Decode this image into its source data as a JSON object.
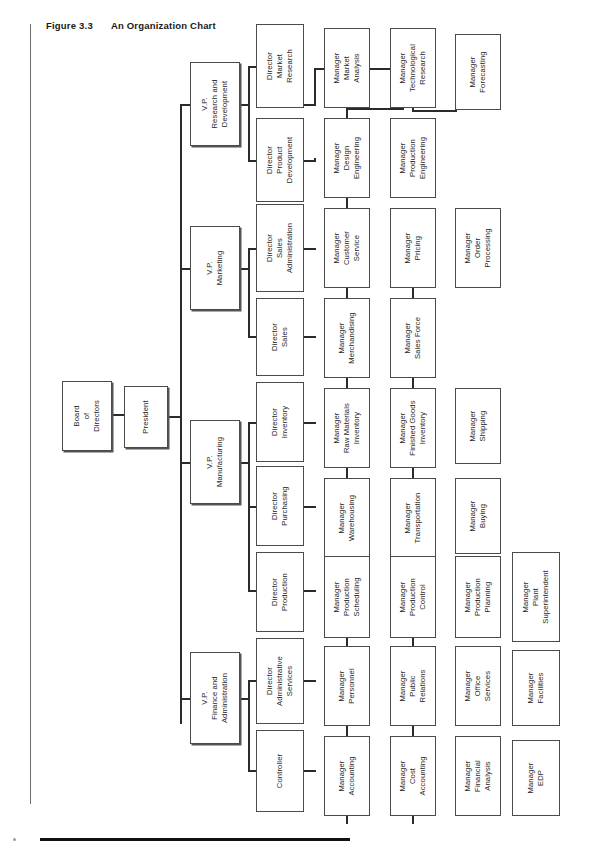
{
  "figure": {
    "number": "Figure 3.3",
    "title": "An Organization Chart"
  },
  "chart_data": {
    "type": "diagram",
    "subtype": "organization-chart",
    "title": "An Organization Chart",
    "orientation": "rotated-90-ccw",
    "levels": [
      "Board",
      "President",
      "Vice Presidents",
      "Directors",
      "Managers"
    ],
    "root": "Board of Directors",
    "nodes": [
      {
        "id": "board",
        "label": "Board\nof\nDirectors",
        "level": 0,
        "parent": null
      },
      {
        "id": "president",
        "label": "President",
        "level": 1,
        "parent": "board"
      },
      {
        "id": "vp_rd",
        "label": "V.P.\nResearch and\nDevelopment",
        "level": 2,
        "parent": "president"
      },
      {
        "id": "vp_mkt",
        "label": "V.P.\nMarketing",
        "level": 2,
        "parent": "president"
      },
      {
        "id": "vp_mfg",
        "label": "V.P.\nManufacturing",
        "level": 2,
        "parent": "president"
      },
      {
        "id": "vp_fin",
        "label": "V.P.\nFinance and\nAdministration",
        "level": 2,
        "parent": "president"
      },
      {
        "id": "d_mktres",
        "label": "Director\nMarket\nResearch",
        "level": 3,
        "parent": "vp_rd"
      },
      {
        "id": "d_proddev",
        "label": "Director\nProduct\nDevelopment",
        "level": 3,
        "parent": "vp_rd"
      },
      {
        "id": "d_salesadm",
        "label": "Director\nSales\nAdministration",
        "level": 3,
        "parent": "vp_mkt"
      },
      {
        "id": "d_sales",
        "label": "Director\nSales",
        "level": 3,
        "parent": "vp_mkt"
      },
      {
        "id": "d_inv",
        "label": "Director\nInventory",
        "level": 3,
        "parent": "vp_mfg"
      },
      {
        "id": "d_purch",
        "label": "Director\nPurchasing",
        "level": 3,
        "parent": "vp_mfg"
      },
      {
        "id": "d_prod",
        "label": "Director\nProduction",
        "level": 3,
        "parent": "vp_mfg"
      },
      {
        "id": "d_admsvc",
        "label": "Director\nAdministrative\nServices",
        "level": 3,
        "parent": "vp_fin"
      },
      {
        "id": "d_ctrl",
        "label": "Controller",
        "level": 3,
        "parent": "vp_fin"
      },
      {
        "id": "m_mktanal",
        "label": "Manager\nMarket\nAnalysis",
        "level": 4,
        "parent": "d_mktres"
      },
      {
        "id": "m_techres",
        "label": "Manager\nTechnological\nResearch",
        "level": 4,
        "parent": "d_mktres"
      },
      {
        "id": "m_forecast",
        "label": "Manager\nForecasting",
        "level": 4,
        "parent": "d_mktres"
      },
      {
        "id": "m_desgeng",
        "label": "Manager\nDesign\nEngineering",
        "level": 4,
        "parent": "d_proddev"
      },
      {
        "id": "m_prodeng",
        "label": "Manager\nProduction\nEngineering",
        "level": 4,
        "parent": "d_proddev"
      },
      {
        "id": "m_custsvc",
        "label": "Manager\nCustomer\nService",
        "level": 4,
        "parent": "d_salesadm"
      },
      {
        "id": "m_pricing",
        "label": "Manager\nPricing",
        "level": 4,
        "parent": "d_salesadm"
      },
      {
        "id": "m_orderproc",
        "label": "Manager\nOrder\nProcessing",
        "level": 4,
        "parent": "d_salesadm"
      },
      {
        "id": "m_merch",
        "label": "Manager\nMerchandising",
        "level": 4,
        "parent": "d_sales"
      },
      {
        "id": "m_salesforce",
        "label": "Manager\nSales Force",
        "level": 4,
        "parent": "d_sales"
      },
      {
        "id": "m_rawmat",
        "label": "Manager\nRaw Materials\nInventory",
        "level": 4,
        "parent": "d_inv"
      },
      {
        "id": "m_fingoods",
        "label": "Manager\nFinished Goods\nInventory",
        "level": 4,
        "parent": "d_inv"
      },
      {
        "id": "m_shipping",
        "label": "Manager\nShipping",
        "level": 4,
        "parent": "d_inv"
      },
      {
        "id": "m_warehouse",
        "label": "Manager\nWarehousing",
        "level": 4,
        "parent": "d_purch"
      },
      {
        "id": "m_transport",
        "label": "Manager\nTransportation",
        "level": 4,
        "parent": "d_purch"
      },
      {
        "id": "m_buying",
        "label": "Manager\nBuying",
        "level": 4,
        "parent": "d_purch"
      },
      {
        "id": "m_prodsched",
        "label": "Manager\nProduction\nScheduling",
        "level": 4,
        "parent": "d_prod"
      },
      {
        "id": "m_prodctrl",
        "label": "Manager\nProduction\nControl",
        "level": 4,
        "parent": "d_prod"
      },
      {
        "id": "m_prodplan",
        "label": "Manager\nProduction\nPlanning",
        "level": 4,
        "parent": "d_prod"
      },
      {
        "id": "m_plantsup",
        "label": "Manager\nPlant\nSuperintendent",
        "level": 4,
        "parent": "d_prod"
      },
      {
        "id": "m_personnel",
        "label": "Manager\nPersonnel",
        "level": 4,
        "parent": "d_admsvc"
      },
      {
        "id": "m_pubrel",
        "label": "Manager\nPublic\nRelations",
        "level": 4,
        "parent": "d_admsvc"
      },
      {
        "id": "m_offsvc",
        "label": "Manager\nOffice\nServices",
        "level": 4,
        "parent": "d_admsvc"
      },
      {
        "id": "m_facil",
        "label": "Manager\nFacilities",
        "level": 4,
        "parent": "d_admsvc"
      },
      {
        "id": "m_acct",
        "label": "Manager\nAccounting",
        "level": 4,
        "parent": "d_ctrl"
      },
      {
        "id": "m_costacct",
        "label": "Manager\nCost\nAccounting",
        "level": 4,
        "parent": "d_ctrl"
      },
      {
        "id": "m_finanal",
        "label": "Manager\nFinancial\nAnalysis",
        "level": 4,
        "parent": "d_ctrl"
      },
      {
        "id": "m_edp",
        "label": "Manager\nEDP",
        "level": 4,
        "parent": "d_ctrl"
      }
    ]
  },
  "layout": {
    "columns": {
      "board": 66,
      "president": 122,
      "vp": 190,
      "director": 256,
      "mgr1": 324,
      "mgr2": 390,
      "mgr3": 455,
      "mgr4": 512
    },
    "box_width": {
      "board": 48,
      "standard": 46,
      "wide": 50
    },
    "colors": {
      "box_border": "#4a4a4a",
      "connector": "#2b2b2b",
      "text": "#262626",
      "rule": "#111111"
    }
  },
  "boxes_positions": [
    {
      "id": "board",
      "x": 62,
      "y": 381,
      "w": 50,
      "h": 70
    },
    {
      "id": "president",
      "x": 124,
      "y": 386,
      "w": 44,
      "h": 62
    },
    {
      "id": "vp_rd",
      "x": 190,
      "y": 62,
      "w": 50,
      "h": 84
    },
    {
      "id": "vp_mkt",
      "x": 190,
      "y": 226,
      "w": 50,
      "h": 84
    },
    {
      "id": "vp_mfg",
      "x": 190,
      "y": 420,
      "w": 50,
      "h": 84
    },
    {
      "id": "vp_fin",
      "x": 190,
      "y": 652,
      "w": 50,
      "h": 92
    },
    {
      "id": "d_mktres",
      "x": 256,
      "y": 24,
      "w": 48,
      "h": 84
    },
    {
      "id": "d_proddev",
      "x": 256,
      "y": 118,
      "w": 48,
      "h": 84
    },
    {
      "id": "d_salesadm",
      "x": 256,
      "y": 204,
      "w": 48,
      "h": 88
    },
    {
      "id": "d_sales",
      "x": 256,
      "y": 298,
      "w": 48,
      "h": 78
    },
    {
      "id": "d_inv",
      "x": 256,
      "y": 382,
      "w": 48,
      "h": 80
    },
    {
      "id": "d_purch",
      "x": 256,
      "y": 466,
      "w": 48,
      "h": 80
    },
    {
      "id": "d_prod",
      "x": 256,
      "y": 552,
      "w": 48,
      "h": 80
    },
    {
      "id": "d_admsvc",
      "x": 256,
      "y": 638,
      "w": 48,
      "h": 86
    },
    {
      "id": "d_ctrl",
      "x": 256,
      "y": 730,
      "w": 48,
      "h": 82
    },
    {
      "id": "m_mktanal",
      "x": 324,
      "y": 28,
      "w": 46,
      "h": 80
    },
    {
      "id": "m_desgeng",
      "x": 324,
      "y": 118,
      "w": 46,
      "h": 80
    },
    {
      "id": "m_custsvc",
      "x": 324,
      "y": 208,
      "w": 46,
      "h": 80
    },
    {
      "id": "m_merch",
      "x": 324,
      "y": 298,
      "w": 46,
      "h": 80
    },
    {
      "id": "m_rawmat",
      "x": 324,
      "y": 388,
      "w": 46,
      "h": 80
    },
    {
      "id": "m_warehouse",
      "x": 324,
      "y": 478,
      "w": 46,
      "h": 80
    },
    {
      "id": "m_prodsched",
      "x": 324,
      "y": 556,
      "w": 46,
      "h": 82
    },
    {
      "id": "m_personnel",
      "x": 324,
      "y": 646,
      "w": 46,
      "h": 80
    },
    {
      "id": "m_acct",
      "x": 324,
      "y": 736,
      "w": 46,
      "h": 80
    },
    {
      "id": "m_techres",
      "x": 390,
      "y": 28,
      "w": 46,
      "h": 80
    },
    {
      "id": "m_prodeng",
      "x": 390,
      "y": 118,
      "w": 46,
      "h": 80
    },
    {
      "id": "m_pricing",
      "x": 390,
      "y": 208,
      "w": 46,
      "h": 80
    },
    {
      "id": "m_salesforce",
      "x": 390,
      "y": 298,
      "w": 46,
      "h": 80
    },
    {
      "id": "m_fingoods",
      "x": 390,
      "y": 388,
      "w": 46,
      "h": 80
    },
    {
      "id": "m_transport",
      "x": 390,
      "y": 478,
      "w": 46,
      "h": 80
    },
    {
      "id": "m_prodctrl",
      "x": 390,
      "y": 556,
      "w": 46,
      "h": 82
    },
    {
      "id": "m_pubrel",
      "x": 390,
      "y": 646,
      "w": 46,
      "h": 80
    },
    {
      "id": "m_costacct",
      "x": 390,
      "y": 736,
      "w": 46,
      "h": 80
    },
    {
      "id": "m_forecast",
      "x": 455,
      "y": 34,
      "w": 46,
      "h": 76
    },
    {
      "id": "m_orderproc",
      "x": 455,
      "y": 208,
      "w": 46,
      "h": 80
    },
    {
      "id": "m_shipping",
      "x": 455,
      "y": 388,
      "w": 46,
      "h": 76
    },
    {
      "id": "m_buying",
      "x": 455,
      "y": 478,
      "w": 46,
      "h": 76
    },
    {
      "id": "m_prodplan",
      "x": 455,
      "y": 556,
      "w": 46,
      "h": 82
    },
    {
      "id": "m_offsvc",
      "x": 455,
      "y": 646,
      "w": 46,
      "h": 80
    },
    {
      "id": "m_finanal",
      "x": 455,
      "y": 736,
      "w": 46,
      "h": 80
    },
    {
      "id": "m_plantsup",
      "x": 512,
      "y": 552,
      "w": 48,
      "h": 90
    },
    {
      "id": "m_facil",
      "x": 512,
      "y": 650,
      "w": 48,
      "h": 76
    },
    {
      "id": "m_edp",
      "x": 512,
      "y": 740,
      "w": 48,
      "h": 76
    }
  ],
  "connectors": [
    {
      "x": 112,
      "y": 414,
      "w": 12,
      "h": 2
    },
    {
      "x": 168,
      "y": 416,
      "w": 12,
      "h": 2
    },
    {
      "x": 180,
      "y": 104,
      "w": 2,
      "h": 620
    },
    {
      "x": 180,
      "y": 104,
      "w": 10,
      "h": 2
    },
    {
      "x": 180,
      "y": 268,
      "w": 10,
      "h": 2
    },
    {
      "x": 180,
      "y": 462,
      "w": 10,
      "h": 2
    },
    {
      "x": 180,
      "y": 698,
      "w": 10,
      "h": 2
    },
    {
      "x": 240,
      "y": 104,
      "w": 10,
      "h": 2
    },
    {
      "x": 248,
      "y": 66,
      "w": 2,
      "h": 96
    },
    {
      "x": 248,
      "y": 66,
      "w": 8,
      "h": 2
    },
    {
      "x": 248,
      "y": 160,
      "w": 8,
      "h": 2
    },
    {
      "x": 240,
      "y": 268,
      "w": 10,
      "h": 2
    },
    {
      "x": 248,
      "y": 248,
      "w": 2,
      "h": 90
    },
    {
      "x": 248,
      "y": 248,
      "w": 8,
      "h": 2
    },
    {
      "x": 248,
      "y": 336,
      "w": 8,
      "h": 2
    },
    {
      "x": 240,
      "y": 462,
      "w": 10,
      "h": 2
    },
    {
      "x": 248,
      "y": 422,
      "w": 2,
      "h": 170
    },
    {
      "x": 248,
      "y": 422,
      "w": 8,
      "h": 2
    },
    {
      "x": 248,
      "y": 506,
      "w": 8,
      "h": 2
    },
    {
      "x": 248,
      "y": 590,
      "w": 8,
      "h": 2
    },
    {
      "x": 240,
      "y": 698,
      "w": 10,
      "h": 2
    },
    {
      "x": 248,
      "y": 680,
      "w": 2,
      "h": 90
    },
    {
      "x": 248,
      "y": 680,
      "w": 8,
      "h": 2
    },
    {
      "x": 248,
      "y": 770,
      "w": 8,
      "h": 2
    },
    {
      "x": 304,
      "y": 104,
      "w": 12,
      "h": 2
    },
    {
      "x": 314,
      "y": 68,
      "w": 2,
      "h": 38
    },
    {
      "x": 314,
      "y": 68,
      "w": 10,
      "h": 2
    },
    {
      "x": 346,
      "y": 108,
      "w": 2,
      "h": 10
    },
    {
      "x": 346,
      "y": 108,
      "w": 58,
      "h": 2
    },
    {
      "x": 412,
      "y": 68,
      "w": 2,
      "h": 42
    },
    {
      "x": 346,
      "y": 68,
      "w": 68,
      "h": 2
    },
    {
      "x": 412,
      "y": 28,
      "w": 2,
      "h": 42
    },
    {
      "x": 455,
      "y": 72,
      "w": 2,
      "h": 38
    },
    {
      "x": 412,
      "y": 110,
      "w": 45,
      "h": 2
    },
    {
      "x": 304,
      "y": 160,
      "w": 12,
      "h": 2
    },
    {
      "x": 314,
      "y": 158,
      "w": 2,
      "h": 2
    },
    {
      "x": 346,
      "y": 198,
      "w": 2,
      "h": 10
    },
    {
      "x": 412,
      "y": 158,
      "w": 2,
      "h": 2
    },
    {
      "x": 304,
      "y": 248,
      "w": 12,
      "h": 2
    },
    {
      "x": 304,
      "y": 336,
      "w": 12,
      "h": 2
    },
    {
      "x": 304,
      "y": 422,
      "w": 12,
      "h": 2
    },
    {
      "x": 304,
      "y": 506,
      "w": 12,
      "h": 2
    },
    {
      "x": 304,
      "y": 590,
      "w": 12,
      "h": 2
    },
    {
      "x": 304,
      "y": 680,
      "w": 12,
      "h": 2
    },
    {
      "x": 304,
      "y": 770,
      "w": 12,
      "h": 2
    },
    {
      "x": 346,
      "y": 288,
      "w": 2,
      "h": 10
    },
    {
      "x": 346,
      "y": 378,
      "w": 2,
      "h": 10
    },
    {
      "x": 346,
      "y": 468,
      "w": 2,
      "h": 10
    },
    {
      "x": 346,
      "y": 638,
      "w": 2,
      "h": 8
    },
    {
      "x": 346,
      "y": 726,
      "w": 2,
      "h": 10
    },
    {
      "x": 346,
      "y": 816,
      "w": 2,
      "h": 8
    },
    {
      "x": 412,
      "y": 288,
      "w": 2,
      "h": 10
    },
    {
      "x": 412,
      "y": 378,
      "w": 2,
      "h": 10
    },
    {
      "x": 412,
      "y": 468,
      "w": 2,
      "h": 10
    },
    {
      "x": 412,
      "y": 638,
      "w": 2,
      "h": 8
    },
    {
      "x": 412,
      "y": 726,
      "w": 2,
      "h": 10
    },
    {
      "x": 412,
      "y": 816,
      "w": 2,
      "h": 8
    }
  ]
}
